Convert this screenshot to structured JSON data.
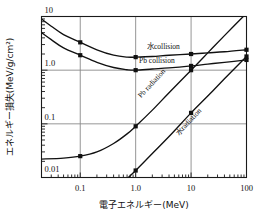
{
  "chart_data": {
    "type": "line",
    "title": "",
    "xlabel": "電子エネルギー(MeV)",
    "ylabel": "エネルギー損失(MeV/g/cm²)",
    "xscale": "log",
    "yscale": "log",
    "xlim": [
      0.02,
      100
    ],
    "ylim": [
      0.01,
      10
    ],
    "grid": true,
    "legend_position": "inline-annotations",
    "xticks": [
      "0.1",
      "1.0",
      "10",
      "100"
    ],
    "xtick_values": [
      0.1,
      1.0,
      10,
      100
    ],
    "yticks": [
      "10",
      "1.0",
      "0.1",
      "0.01"
    ],
    "ytick_values": [
      10,
      1.0,
      0.1,
      0.01
    ],
    "series": [
      {
        "name": "水collision",
        "label": "水collision",
        "x": [
          0.02,
          0.03,
          0.05,
          0.1,
          0.2,
          0.4,
          0.7,
          1.0,
          2.0,
          4.0,
          10.0,
          20.0,
          40.0,
          100.0
        ],
        "y": [
          9.0,
          6.6,
          4.6,
          3.3,
          2.4,
          1.9,
          1.75,
          1.75,
          1.8,
          1.9,
          2.0,
          2.1,
          2.2,
          2.4
        ],
        "markers_x": [
          0.1,
          1.0,
          10.0,
          100.0
        ],
        "markers_y": [
          3.3,
          1.75,
          2.0,
          2.4
        ]
      },
      {
        "name": "Pb collision",
        "label": "Pb collision",
        "x": [
          0.02,
          0.03,
          0.05,
          0.1,
          0.2,
          0.4,
          0.7,
          1.0,
          2.0,
          4.0,
          10.0,
          20.0,
          40.0,
          100.0
        ],
        "y": [
          5.0,
          3.7,
          2.6,
          1.9,
          1.4,
          1.12,
          1.02,
          1.0,
          1.05,
          1.1,
          1.2,
          1.3,
          1.4,
          1.55
        ],
        "markers_x": [
          0.1,
          1.0,
          10.0,
          100.0
        ],
        "markers_y": [
          1.9,
          1.0,
          1.2,
          1.55
        ]
      },
      {
        "name": "Pb radiation",
        "label": "Pb radiation",
        "x": [
          0.02,
          0.05,
          0.1,
          0.2,
          0.4,
          0.7,
          1.0,
          2.0,
          4.0,
          10.0,
          20.0,
          40.0,
          100.0
        ],
        "y": [
          0.022,
          0.023,
          0.025,
          0.03,
          0.043,
          0.065,
          0.09,
          0.18,
          0.38,
          1.0,
          2.1,
          4.4,
          11.5
        ],
        "markers_x": [
          0.1,
          1.0,
          10.0
        ],
        "markers_y": [
          0.025,
          0.09,
          1.0
        ]
      },
      {
        "name": "水radiation",
        "label": "水radiation",
        "x": [
          0.7,
          1.0,
          2.0,
          4.0,
          10.0,
          20.0,
          40.0,
          100.0
        ],
        "y": [
          0.0095,
          0.0135,
          0.028,
          0.058,
          0.16,
          0.33,
          0.69,
          1.8
        ],
        "markers_x": [
          1.0,
          10.0,
          100.0
        ],
        "markers_y": [
          0.0135,
          0.16,
          1.8
        ]
      }
    ],
    "annotations": [
      {
        "text": "水collision",
        "x": 1.6,
        "y": 2.45,
        "rotation": 0
      },
      {
        "text": "Pb collision",
        "x": 1.15,
        "y": 1.35,
        "rotation": 0
      },
      {
        "text": "Pb radiation",
        "x": 1.25,
        "y": 0.3,
        "rotation": -47
      },
      {
        "text": "水radiation",
        "x": 6.0,
        "y": 0.06,
        "rotation": -47
      }
    ]
  },
  "figure": {
    "xlabel": "電子エネルギー(MeV)",
    "ylabel_main": "エネルギー損失",
    "ylabel_unit": "(MeV/g/cm²)",
    "axis_color": "#1a1a1a",
    "grid_color": "#8a8a8a",
    "curve_color": "#111111",
    "background": "#ffffff"
  }
}
